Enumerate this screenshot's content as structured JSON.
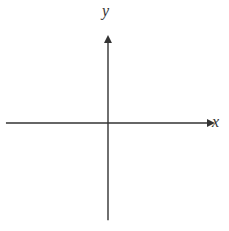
{
  "chart_data": {
    "type": "line",
    "title": "",
    "xlabel": "x",
    "ylabel": "y",
    "xlim": [
      -6.5,
      6.3
    ],
    "ylim": [
      -6.2,
      5.6
    ],
    "x_ticks": [
      -5,
      -4,
      -3,
      -2,
      -1,
      1,
      2,
      3,
      4,
      5,
      6
    ],
    "y_ticks": [
      -5,
      -4,
      -3,
      -2,
      -1,
      1,
      2,
      3,
      4,
      5
    ],
    "tick_labels": {
      "x": [
        {
          "value": -5,
          "label": "−5"
        },
        {
          "value": 5,
          "label": "5"
        }
      ],
      "y": [
        {
          "value": -5,
          "label": "−5"
        }
      ],
      "origin": "0"
    },
    "grid": false,
    "legend": null,
    "series": [
      {
        "name": "line",
        "equation": "y = -1.5x + 4.5",
        "x": [
          -1.15,
          0,
          3,
          6.05
        ],
        "y": [
          6.2,
          4.5,
          0,
          -4.6
        ],
        "arrows_both_ends": true,
        "color": "#222222"
      }
    ],
    "colors": {
      "axis": "#333333",
      "line": "#222222",
      "background": "#ffffff"
    }
  }
}
